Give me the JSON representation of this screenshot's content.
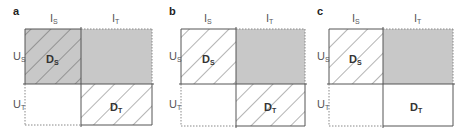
{
  "figure": {
    "panels": [
      {
        "letter": "a",
        "x_labels": [
          "I",
          "I"
        ],
        "x_subs": [
          "S",
          "T"
        ],
        "y_labels": [
          "U",
          "U"
        ],
        "y_subs": [
          "S",
          "T"
        ],
        "ds_label": "D",
        "ds_sub": "S",
        "dt_label": "D",
        "dt_sub": "T",
        "ds_fill": "gray-hatched",
        "ur_fill": "gray",
        "ll_fill": "white",
        "dt_fill": "hatched"
      },
      {
        "letter": "b",
        "x_labels": [
          "I",
          "I"
        ],
        "x_subs": [
          "S",
          "T"
        ],
        "y_labels": [
          "U",
          "U"
        ],
        "y_subs": [
          "S",
          "T"
        ],
        "ds_label": "D",
        "ds_sub": "S",
        "dt_label": "D",
        "dt_sub": "T",
        "ds_fill": "hatched",
        "ur_fill": "gray",
        "ll_fill": "white",
        "dt_fill": "hatched"
      },
      {
        "letter": "c",
        "x_labels": [
          "I",
          "I"
        ],
        "x_subs": [
          "S",
          "T"
        ],
        "y_labels": [
          "U",
          "U"
        ],
        "y_subs": [
          "S",
          "T"
        ],
        "ds_label": "D",
        "ds_sub": "S",
        "dt_label": "D",
        "dt_sub": "T",
        "ds_fill": "hatched",
        "ur_fill": "gray",
        "ll_fill": "white",
        "dt_fill": "white"
      }
    ],
    "colors": {
      "gray_fill": "#c8c8c8",
      "line": "#555555",
      "hatch": "#444444"
    }
  }
}
